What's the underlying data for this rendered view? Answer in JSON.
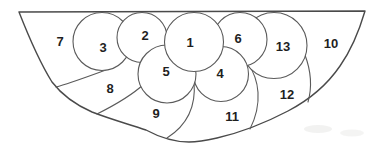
{
  "figure": {
    "name": "semicircle-partitioned-into-13-numbered-regions",
    "background": "#ffffff",
    "stroke_color": "#4a4a4a",
    "label_color": "#1f1f1f",
    "region_count": 13,
    "regions": [
      {
        "label": "1",
        "x": 190,
        "y": 42
      },
      {
        "label": "2",
        "x": 145,
        "y": 35
      },
      {
        "label": "3",
        "x": 103,
        "y": 47
      },
      {
        "label": "4",
        "x": 220,
        "y": 73
      },
      {
        "label": "5",
        "x": 166,
        "y": 71
      },
      {
        "label": "6",
        "x": 238,
        "y": 38
      },
      {
        "label": "7",
        "x": 60,
        "y": 41
      },
      {
        "label": "8",
        "x": 110,
        "y": 88
      },
      {
        "label": "9",
        "x": 156,
        "y": 113
      },
      {
        "label": "10",
        "x": 331,
        "y": 43
      },
      {
        "label": "11",
        "x": 232,
        "y": 116
      },
      {
        "label": "12",
        "x": 287,
        "y": 94
      },
      {
        "label": "13",
        "x": 283,
        "y": 46
      }
    ]
  }
}
